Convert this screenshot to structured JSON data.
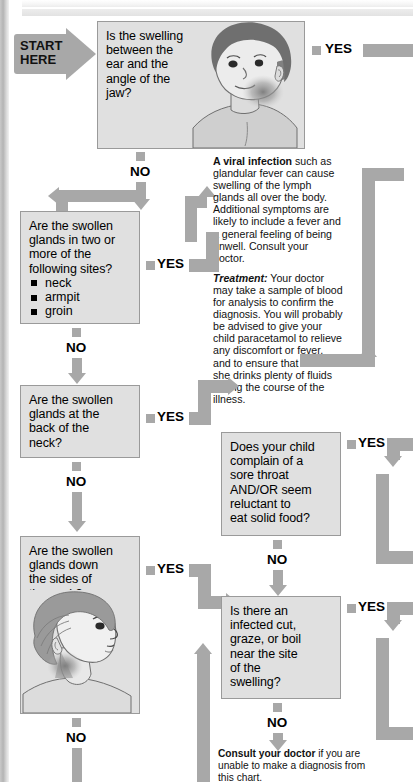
{
  "start": {
    "line1": "START",
    "line2": "HERE"
  },
  "labels": {
    "yes": "YES",
    "no": "NO"
  },
  "questions": {
    "q1": "Is the swelling\nbetween the\near and the\nangle of the\njaw?",
    "q2_head": "Are the swollen\nglands in two or\nmore of the\nfollowing sites?",
    "q2_items": [
      "neck",
      "armpit",
      "groin"
    ],
    "q3": "Are the swollen\nglands at the\nback of the\nneck?",
    "q4": "Are the swollen\nglands down\nthe sides of\nthe neck?",
    "q5": "Does your child\ncomplain of a\nsore throat\nAND/OR seem\nreluctant to\neat solid food?",
    "q6": "Is there an\ninfected cut,\ngraze, or boil\nnear the site\nof the\nswelling?"
  },
  "advice": {
    "viral_lead": "A viral infection",
    "viral_body": " such as glandular fever can cause swelling of the lymph glands all over the body. Additional symptoms are likely to include a fever and a general feeling of being unwell. Consult your doctor.",
    "treatment_lead": "Treatment:",
    "treatment_body": " Your doctor may take a sample of blood for analysis to confirm the diagnosis. You will probably be advised to give your child paracetamol to relieve any discomfort or fever, and to ensure that he or she drinks plenty of fluids during the course of the illness."
  },
  "footer": {
    "lead": "Consult your doctor",
    "body": " if you are unable to make a diagnosis from this chart."
  },
  "illustrations": {
    "child_front": "child-head-front-swollen-jaw-illustration",
    "child_side": "child-head-side-swollen-neck-illustration"
  },
  "colors": {
    "arrow": "#a8a8a8",
    "box_fill": "#e0e0e0",
    "box_border": "#9a9a9a",
    "text": "#000000"
  }
}
